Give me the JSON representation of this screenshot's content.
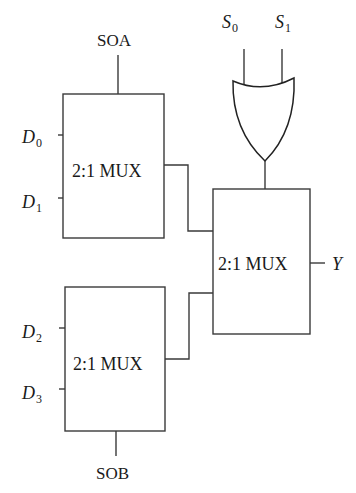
{
  "diagram": {
    "type": "logic-circuit",
    "components": {
      "mux_top": {
        "label": "2:1 MUX",
        "inputs": [
          "D0",
          "D1"
        ],
        "select": "SOA"
      },
      "mux_bottom": {
        "label": "2:1 MUX",
        "inputs": [
          "D2",
          "D3"
        ],
        "select": "SOB"
      },
      "mux_right": {
        "label": "2:1 MUX",
        "output": "Y"
      },
      "or_gate": {
        "type": "OR",
        "inputs": [
          "S0",
          "S1"
        ]
      }
    },
    "labels": {
      "soa": "SOA",
      "sob": "SOB",
      "d0": {
        "main": "D",
        "sub": "0"
      },
      "d1": {
        "main": "D",
        "sub": "1"
      },
      "d2": {
        "main": "D",
        "sub": "2"
      },
      "d3": {
        "main": "D",
        "sub": "3"
      },
      "s0": {
        "main": "S",
        "sub": "0"
      },
      "s1": {
        "main": "S",
        "sub": "1"
      },
      "y": "Y",
      "mux_top": "2:1 MUX",
      "mux_bottom": "2:1 MUX",
      "mux_right": "2:1 MUX"
    },
    "connections": [
      {
        "from": "mux_top.output",
        "to": "mux_right.input0"
      },
      {
        "from": "mux_bottom.output",
        "to": "mux_right.input1"
      },
      {
        "from": "or_gate.output",
        "to": "mux_right.select"
      },
      {
        "from": "mux_right.output",
        "to": "Y"
      }
    ]
  }
}
